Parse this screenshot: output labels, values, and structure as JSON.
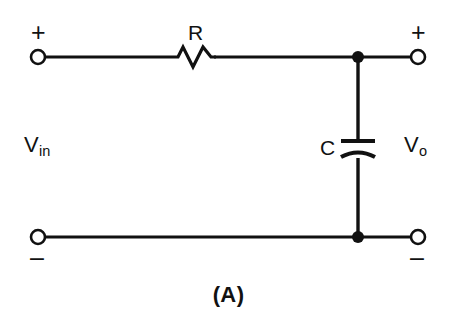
{
  "figure": {
    "caption": "(A)",
    "kind": "schematic",
    "background_color": "#ffffff",
    "line_color": "#111111"
  },
  "components": {
    "resistor": {
      "designator": "R",
      "symbol": "zigzag",
      "orientation": "horizontal"
    },
    "capacitor": {
      "designator": "C",
      "symbol": "polarized-plates",
      "orientation": "vertical"
    }
  },
  "ports": {
    "input": {
      "label_text": "V",
      "label_sub": "in",
      "plus_sign": "+",
      "minus_sign": "–"
    },
    "output": {
      "label_text": "V",
      "label_sub": "o",
      "plus_sign": "+",
      "minus_sign": "–"
    }
  },
  "terminals": [
    {
      "name": "input-positive",
      "polarity": "+"
    },
    {
      "name": "input-negative",
      "polarity": "–"
    },
    {
      "name": "output-positive",
      "polarity": "+"
    },
    {
      "name": "output-negative",
      "polarity": "–"
    }
  ],
  "nodes": [
    {
      "name": "top-junction"
    },
    {
      "name": "bottom-junction"
    }
  ]
}
